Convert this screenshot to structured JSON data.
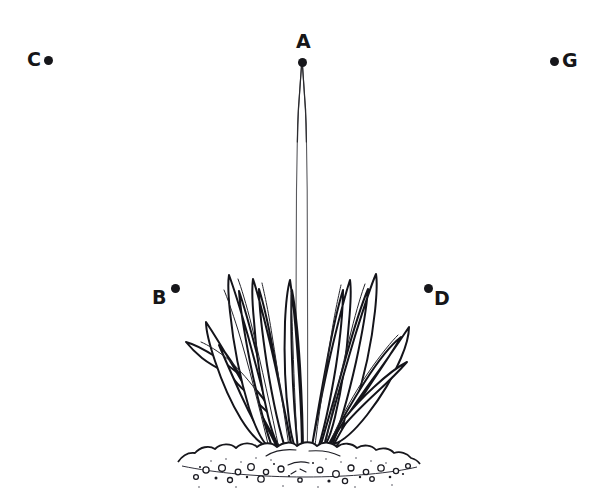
{
  "figure": {
    "kind": "line-drawing",
    "background_color": "#ffffff",
    "ink_color": "#161618",
    "parts": {
      "stalk_label": "flower stalk",
      "leaves_label": "leaf rosette",
      "ground_label": "soil mound"
    }
  },
  "markers": [
    {
      "id": "A",
      "label": "A",
      "x": 302,
      "y": 62,
      "label_position": "above",
      "points_at": "tip of the flower stalk"
    },
    {
      "id": "C",
      "label": "C",
      "x": 48,
      "y": 60,
      "label_position": "left",
      "points_at": "empty background, upper left"
    },
    {
      "id": "G",
      "label": "G",
      "x": 554,
      "y": 61,
      "label_position": "right",
      "points_at": "empty background, upper right"
    },
    {
      "id": "B",
      "label": "B",
      "x": 175,
      "y": 288,
      "label_position": "below-left",
      "points_at": "empty background, left of the plant"
    },
    {
      "id": "D",
      "label": "D",
      "x": 428,
      "y": 288,
      "label_position": "below-right",
      "points_at": "empty background, right of the plant"
    }
  ]
}
